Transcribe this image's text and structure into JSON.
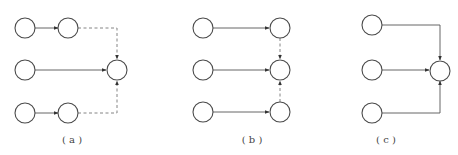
{
  "diagram": {
    "panels": [
      {
        "id": "a",
        "label": "( a )",
        "nodes": [
          "a1",
          "a2",
          "a3",
          "a4",
          "a5",
          "a6"
        ],
        "edges": [
          {
            "from": "a1",
            "to": "a2",
            "style": "solid"
          },
          {
            "from": "a3",
            "to": "a6",
            "style": "solid"
          },
          {
            "from": "a4",
            "to": "a5",
            "style": "solid"
          },
          {
            "from": "a2",
            "to": "a6",
            "style": "dashed"
          },
          {
            "from": "a5",
            "to": "a6",
            "style": "dashed"
          }
        ]
      },
      {
        "id": "b",
        "label": "( b )",
        "nodes": [
          "b1",
          "b2",
          "b3",
          "b4",
          "b5",
          "b6"
        ],
        "edges": [
          {
            "from": "b1",
            "to": "b2",
            "style": "solid"
          },
          {
            "from": "b3",
            "to": "b4",
            "style": "solid"
          },
          {
            "from": "b5",
            "to": "b6",
            "style": "solid"
          },
          {
            "from": "b2",
            "to": "b4",
            "style": "dashed"
          },
          {
            "from": "b6",
            "to": "b4",
            "style": "dashed"
          }
        ]
      },
      {
        "id": "c",
        "label": "( c )",
        "nodes": [
          "c1",
          "c2",
          "c3",
          "c4"
        ],
        "edges": [
          {
            "from": "c1",
            "to": "c4",
            "style": "solid"
          },
          {
            "from": "c2",
            "to": "c4",
            "style": "solid"
          },
          {
            "from": "c3",
            "to": "c4",
            "style": "solid"
          }
        ]
      }
    ]
  }
}
